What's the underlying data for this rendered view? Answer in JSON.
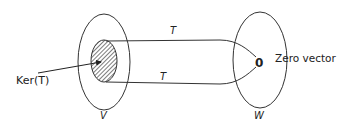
{
  "diagram": {
    "domain_space": {
      "label": "V"
    },
    "codomain_space": {
      "label": "W"
    },
    "kernel": {
      "label": "Ker(T)"
    },
    "mappings": [
      {
        "label": "T",
        "position": "top"
      },
      {
        "label": "T",
        "position": "bottom"
      }
    ],
    "target_point": {
      "symbol": "0",
      "label": "Zero vector"
    },
    "colors": {
      "stroke": "#333333",
      "hatch": "#444444",
      "background": "#ffffff"
    }
  }
}
